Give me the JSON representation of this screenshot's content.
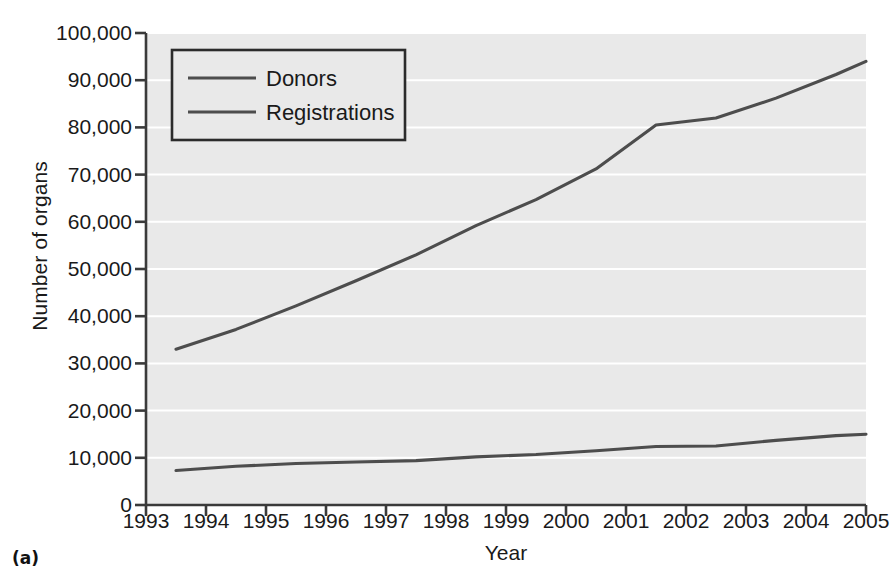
{
  "caption": "(a)",
  "chart_data": {
    "type": "line",
    "title": "",
    "xlabel": "Year",
    "ylabel": "Number of organs",
    "xlim": [
      1993,
      2005
    ],
    "ylim": [
      0,
      100000
    ],
    "grid": "horizontal",
    "legend_position": "top-left",
    "xticks": [
      "1993",
      "1994",
      "1995",
      "1996",
      "1997",
      "1998",
      "1999",
      "2000",
      "2001",
      "2002",
      "2003",
      "2004",
      "2005"
    ],
    "xtick_values": [
      1993,
      1994,
      1995,
      1996,
      1997,
      1998,
      1999,
      2000,
      2001,
      2002,
      2003,
      2004,
      2005
    ],
    "yticks": [
      "0",
      "10,000",
      "20,000",
      "30,000",
      "40,000",
      "50,000",
      "60,000",
      "70,000",
      "80,000",
      "90,000",
      "100,000"
    ],
    "ytick_values": [
      0,
      10000,
      20000,
      30000,
      40000,
      50000,
      60000,
      70000,
      80000,
      90000,
      100000
    ],
    "x": [
      1993.5,
      1994.5,
      1995.5,
      1996.5,
      1997.5,
      1998.5,
      1999.5,
      2000.5,
      2001.5,
      2002.5,
      2003.5,
      2004.5,
      2005.0
    ],
    "series": [
      {
        "name": "Donors",
        "color": "#4d4d4d",
        "values": [
          7300,
          8200,
          8800,
          9100,
          9400,
          10200,
          10700,
          11500,
          12400,
          12500,
          13700,
          14700,
          15000
        ]
      },
      {
        "name": "Registrations",
        "color": "#4d4d4d",
        "values": [
          33000,
          37200,
          42200,
          47500,
          53000,
          59200,
          64700,
          71200,
          80500,
          82000,
          86200,
          91200,
          94000
        ]
      }
    ],
    "legend_entries": [
      "Donors",
      "Registrations"
    ],
    "colors": {
      "plot_background": "#e9e9e9",
      "gridline": "#ffffff",
      "axis": "#3a3a3a",
      "line": "#4d4d4d",
      "text": "#1a1a1a"
    }
  }
}
